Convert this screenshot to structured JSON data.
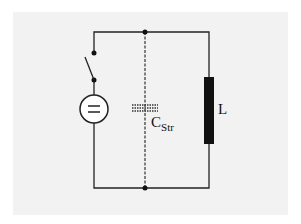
{
  "diagram": {
    "type": "circuit",
    "labels": {
      "inductor": "L",
      "capacitor_main": "C",
      "capacitor_sub": "Str"
    },
    "components": [
      {
        "id": "dc-source",
        "symbol": "="
      },
      {
        "id": "switch",
        "state": "open"
      },
      {
        "id": "stray-capacitance",
        "style": "dashed"
      },
      {
        "id": "inductor",
        "label": "L"
      }
    ],
    "colors": {
      "wire": "#222222",
      "background": "#f2f2f2"
    }
  }
}
